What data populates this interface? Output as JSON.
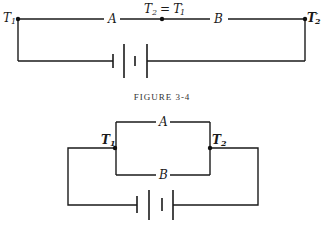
{
  "figure_3_4": {
    "caption": "FIGURE 3-4",
    "nodes": {
      "t1": {
        "main": "T",
        "sub": "1"
      },
      "mid_left": {
        "main": "T",
        "sub": "2"
      },
      "mid_eq": "=",
      "mid_right": {
        "main": "T",
        "sup": "′",
        "sub": "1"
      },
      "t2p": {
        "main": "T",
        "sup": "′",
        "sub": "2"
      }
    },
    "resistors": {
      "a": "A",
      "b": "B"
    },
    "battery": "battery-cells-icon"
  },
  "figure_3_5": {
    "caption": "FIGURE 3-5",
    "nodes": {
      "t1": {
        "main": "T",
        "sub": "1"
      },
      "t2": {
        "main": "T",
        "sub": "2"
      }
    },
    "resistors": {
      "a": "A",
      "b": "B"
    },
    "battery": "battery-cells-icon"
  },
  "colors": {
    "line": "#1a1a1a",
    "background": "#ffffff",
    "caption": "#333333"
  }
}
